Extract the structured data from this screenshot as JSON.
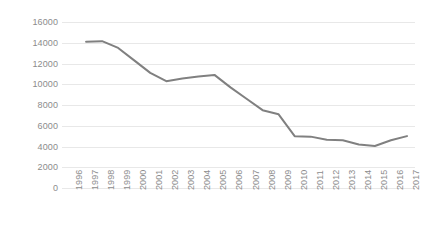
{
  "chart_data": {
    "type": "line",
    "title": "",
    "subtitle": "",
    "xlabel": "",
    "ylabel": "",
    "categories": [
      "1996",
      "1997",
      "1998",
      "1999",
      "2000",
      "2001",
      "2002",
      "2003",
      "2004",
      "2005",
      "2006",
      "2007",
      "2008",
      "2009",
      "2010",
      "2011",
      "2012",
      "2013",
      "2014",
      "2015",
      "2016",
      "2017"
    ],
    "x": [
      1996,
      1997,
      1998,
      1999,
      2000,
      2001,
      2002,
      2003,
      2004,
      2005,
      2006,
      2007,
      2008,
      2009,
      2010,
      2011,
      2012,
      2013,
      2014,
      2015,
      2016,
      2017
    ],
    "values": [
      null,
      14100,
      14150,
      13500,
      12300,
      11100,
      10300,
      10550,
      10750,
      10900,
      9700,
      8600,
      7500,
      7100,
      5000,
      4950,
      4650,
      4600,
      4200,
      4050,
      4600,
      5000
    ],
    "series": [
      {
        "name": "Series 1",
        "color": "#808080",
        "values": [
          null,
          14100,
          14150,
          13500,
          12300,
          11100,
          10300,
          10550,
          10750,
          10900,
          9700,
          8600,
          7500,
          7100,
          5000,
          4950,
          4650,
          4600,
          4200,
          4050,
          4600,
          5000
        ]
      }
    ],
    "y_ticks": [
      0,
      2000,
      4000,
      6000,
      8000,
      10000,
      12000,
      14000,
      16000
    ],
    "y_tick_labels": [
      "0",
      "2000",
      "4000",
      "6000",
      "8000",
      "10000",
      "12000",
      "14000",
      "16000"
    ],
    "ylim": [
      0,
      16000
    ],
    "xlim": [
      1996,
      2018
    ],
    "grid": true,
    "grid_axis": "y",
    "legend": false,
    "legend_position": "none",
    "annotations": [],
    "colors": {
      "line": "#808080",
      "gridline": "#e8e8e8",
      "tick_label": "#8c8c8c",
      "background": "#ffffff"
    }
  }
}
